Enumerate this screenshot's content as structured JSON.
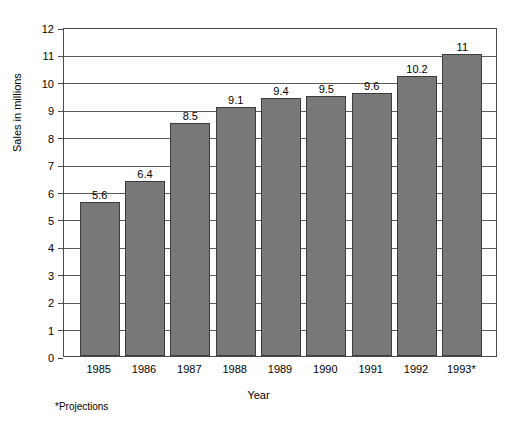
{
  "chart_data": {
    "type": "bar",
    "title": "",
    "xlabel": "Year",
    "ylabel": "Sales in millions",
    "categories": [
      "1985",
      "1986",
      "1987",
      "1988",
      "1989",
      "1990",
      "1991",
      "1992",
      "1993*"
    ],
    "values": [
      5.6,
      6.4,
      8.5,
      9.1,
      9.4,
      9.5,
      9.6,
      10.2,
      11
    ],
    "value_labels": [
      "5.6",
      "6.4",
      "8.5",
      "9.1",
      "9.4",
      "9.5",
      "9.6",
      "10.2",
      "11"
    ],
    "ylim": [
      0,
      12
    ],
    "ytick_labels": [
      "0",
      "1",
      "2",
      "3",
      "4",
      "5",
      "6",
      "7",
      "8",
      "9",
      "10",
      "11",
      "12"
    ],
    "ytick_values": [
      0,
      1,
      2,
      3,
      4,
      5,
      6,
      7,
      8,
      9,
      10,
      11,
      12
    ],
    "grid": "horizontal",
    "legend": "none",
    "footnote": "*Projections",
    "bar_color": "#787878",
    "bar_edge_color": "#3c3c3c",
    "grid_color": "#5a5a5a",
    "frame_color": "#4a4a4a",
    "background_color": "#ffffff"
  }
}
